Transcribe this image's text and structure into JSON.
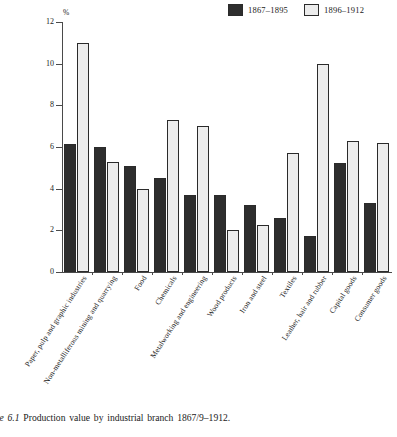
{
  "caption": {
    "figure_number": "Figure 6.1",
    "text": "Production value by industrial branch 1867/9–1912."
  },
  "legend": {
    "entries": [
      {
        "label": "1867–1895",
        "style": "dark"
      },
      {
        "label": "1896–1912",
        "style": "light"
      }
    ]
  },
  "axis": {
    "y_unit": "%",
    "y_ticks": [
      "0",
      "2",
      "4",
      "6",
      "8",
      "10",
      "12"
    ]
  },
  "colors": {
    "series_1": "#2e2e2e",
    "series_2": "#ededed",
    "outline": "#2b2b2b",
    "axis": "#4a4a4a"
  },
  "chart_data": {
    "type": "bar",
    "title": "Production value by industrial branch 1867/9–1912.",
    "xlabel": "",
    "ylabel": "%",
    "ylim": [
      0,
      12
    ],
    "ytick_step": 2,
    "grid": false,
    "legend_position": "top-right",
    "categories": [
      "Paper, pulp and graphic industries",
      "Non-metalliferous mining and quarrying",
      "Food",
      "Chemicals",
      "Metalworking and engineering",
      "Wood products",
      "Iron and steel",
      "Textiles",
      "Leather, hair and rubber",
      "Capital goods",
      "Consumer goods"
    ],
    "series": [
      {
        "name": "1867–1895",
        "values": [
          6.15,
          6.0,
          5.1,
          4.5,
          3.7,
          3.7,
          3.2,
          2.6,
          1.75,
          5.25,
          3.3
        ]
      },
      {
        "name": "1896–1912",
        "values": [
          11.0,
          5.3,
          4.0,
          7.3,
          7.0,
          2.0,
          2.25,
          5.7,
          10.0,
          6.3,
          6.2
        ]
      }
    ]
  }
}
